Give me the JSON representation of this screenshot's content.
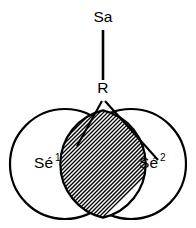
{
  "diagram": {
    "type": "venn-two-circle-intersection",
    "background_color": "#ffffff",
    "line_color": "#000000",
    "nodes": {
      "signifier": {
        "label": "Sa",
        "x": 103,
        "y": 22
      },
      "referent": {
        "label": "R",
        "x": 103,
        "y": 93
      },
      "signified_one": {
        "label_base": "Sé",
        "label_sup": "1",
        "label_full": "Sé¹",
        "x": 48,
        "y": 168
      },
      "signified_two": {
        "label_base": "Sé",
        "label_sup": "2",
        "label_full": "Sé²",
        "x": 145,
        "y": 168
      }
    },
    "circles": [
      {
        "name": "left-circle",
        "cx": 65,
        "cy": 164,
        "r": 55
      },
      {
        "name": "right-circle",
        "cx": 131,
        "cy": 164,
        "r": 55
      }
    ],
    "intersection": {
      "name": "hatched-lens",
      "pattern": "diagonal-hatch",
      "hatch_angle_degrees": 45,
      "hatch_spacing_px": 4,
      "fill_color": "#ffffff",
      "hatch_color": "#000000"
    },
    "edges": [
      {
        "name": "sa-to-r",
        "from": "Sa",
        "to": "R",
        "x1": 103,
        "y1": 30,
        "x2": 103,
        "y2": 80
      },
      {
        "name": "r-to-se1",
        "from": "R",
        "to": "Sé¹",
        "x1": 103,
        "y1": 101,
        "x2": 77,
        "y2": 146
      },
      {
        "name": "r-to-se2",
        "from": "R",
        "to": "Sé²",
        "x1": 105,
        "y1": 101,
        "x2": 158,
        "y2": 160
      }
    ]
  }
}
